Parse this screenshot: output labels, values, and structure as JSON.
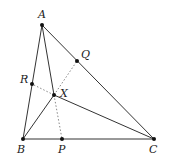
{
  "diagram": {
    "type": "geometry",
    "colors": {
      "line": "#333333",
      "dotted": "#888888",
      "point": "#111111",
      "background": "#ffffff"
    },
    "points": {
      "A": {
        "label": "A",
        "x": 42,
        "y": 25
      },
      "B": {
        "label": "B",
        "x": 23,
        "y": 139
      },
      "C": {
        "label": "C",
        "x": 154,
        "y": 139
      },
      "P": {
        "label": "P",
        "x": 62,
        "y": 139
      },
      "Q": {
        "label": "Q",
        "x": 77,
        "y": 61
      },
      "R": {
        "label": "R",
        "x": 32,
        "y": 84
      },
      "X": {
        "label": "X",
        "x": 54,
        "y": 95
      }
    },
    "solid_segments": [
      [
        "A",
        "B"
      ],
      [
        "B",
        "C"
      ],
      [
        "C",
        "A"
      ],
      [
        "A",
        "X"
      ],
      [
        "B",
        "X"
      ],
      [
        "C",
        "X"
      ]
    ],
    "dotted_segments": [
      [
        "X",
        "P"
      ],
      [
        "X",
        "Q"
      ],
      [
        "X",
        "R"
      ]
    ]
  }
}
